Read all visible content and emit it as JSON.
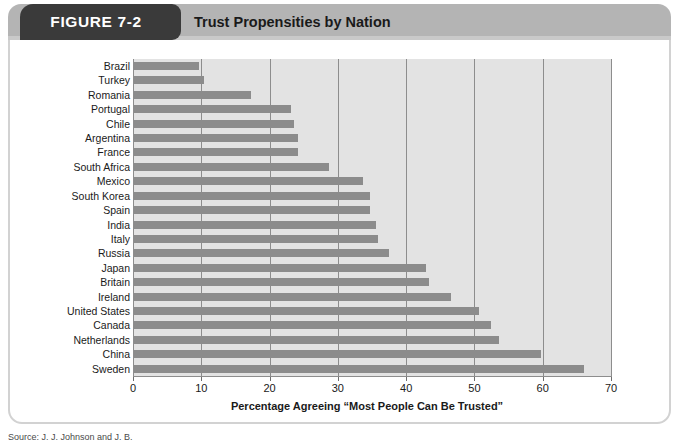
{
  "header": {
    "figure_tab_label": "FIGURE 7-2",
    "title": "Trust Propensities by Nation"
  },
  "footer": {
    "source_note": "Source: J. J. Johnson and J. B."
  },
  "colors": {
    "tab_background": "#3a3a3a",
    "header_background": "#b4b4b4",
    "plot_background": "#e3e3e3",
    "bar_fill": "#8c8c8c",
    "gridline": "#8d8d8d",
    "card_border": "#d2d2d2",
    "text": "#1a1a1a"
  },
  "chart_data": {
    "type": "bar",
    "orientation": "horizontal",
    "title": "Trust Propensities by Nation",
    "xlabel": "Percentage Agreeing “Most People Can Be Trusted”",
    "ylabel": "",
    "xlim": [
      0,
      70
    ],
    "xticks": [
      0,
      10,
      20,
      30,
      40,
      50,
      60,
      70
    ],
    "xtick_labels": [
      "0",
      "10",
      "20",
      "30",
      "40",
      "50",
      "60",
      "70"
    ],
    "grid": "vertical",
    "legend": null,
    "categories": [
      "Brazil",
      "Turkey",
      "Romania",
      "Portugal",
      "Chile",
      "Argentina",
      "France",
      "South Africa",
      "Mexico",
      "South Korea",
      "Spain",
      "India",
      "Italy",
      "Russia",
      "Japan",
      "Britain",
      "Ireland",
      "United States",
      "Canada",
      "Netherlands",
      "China",
      "Sweden"
    ],
    "values": [
      9.5,
      10.2,
      17.1,
      23.0,
      23.4,
      24.0,
      24.0,
      28.5,
      33.5,
      34.5,
      34.5,
      35.5,
      35.7,
      37.3,
      42.8,
      43.2,
      46.4,
      50.5,
      52.3,
      53.5,
      59.6,
      65.9
    ]
  }
}
